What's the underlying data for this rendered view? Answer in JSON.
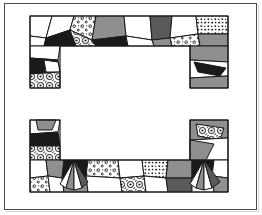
{
  "figure": {
    "background_color": "#ffffff",
    "frame_color": "#4a4a4a",
    "ink_color": "#1a1a1a",
    "canvas": {
      "width": 262,
      "height": 215
    }
  },
  "palette": {
    "white": "#ffffff",
    "light_gray": "#d9d9d9",
    "mid_gray": "#8f8f8f",
    "dark_gray": "#5a5a5a",
    "black": "#1a1a1a",
    "stipple_ink": "#1a1a1a",
    "stipple_ground": "#ffffff"
  },
  "frame": {
    "outer": {
      "x": 4,
      "y": 3,
      "width": 253,
      "height": 207,
      "stroke": 1
    }
  },
  "chart_data": {
    "type": "diagram",
    "xlabel": "",
    "ylabel": "",
    "shapes": [
      {
        "name": "upper-bracket",
        "orientation": "inverted-u",
        "bounds": {
          "x": 28,
          "y": 14,
          "width": 202,
          "height": 75
        },
        "bar": {
          "x": 28,
          "y": 14,
          "width": 202,
          "height": 32
        },
        "left_leg": {
          "x": 28,
          "y": 46,
          "width": 32,
          "height": 43
        },
        "right_leg": {
          "x": 190,
          "y": 46,
          "width": 40,
          "height": 43
        }
      },
      {
        "name": "lower-bracket",
        "orientation": "u",
        "bounds": {
          "x": 28,
          "y": 118,
          "width": 202,
          "height": 76
        },
        "bar": {
          "x": 28,
          "y": 160,
          "width": 202,
          "height": 34
        },
        "left_leg": {
          "x": 28,
          "y": 118,
          "width": 33,
          "height": 42
        },
        "right_leg": {
          "x": 190,
          "y": 118,
          "width": 40,
          "height": 42
        }
      }
    ],
    "fill_kinds": [
      "white",
      "light_gray",
      "mid_gray",
      "dark_gray",
      "black",
      "stipple-rings",
      "stipple-dots",
      "stipple-specks"
    ],
    "patch_count": 58
  },
  "patches": {
    "upper": [
      {
        "id": "u01",
        "fill": "white",
        "pts": "30,16 52,16 46,38 30,36"
      },
      {
        "id": "u02",
        "fill": "white",
        "pts": "52,16 74,16 70,30 46,38"
      },
      {
        "id": "u03",
        "fill": "stipple-dots",
        "pts": "74,16 96,16 92,40 70,30"
      },
      {
        "id": "u04",
        "fill": "mid_gray",
        "pts": "96,16 124,16 126,36 92,40"
      },
      {
        "id": "u05",
        "fill": "white",
        "pts": "124,16 150,16 152,40 126,36"
      },
      {
        "id": "u06",
        "fill": "dark_gray",
        "pts": "150,16 172,16 170,38 152,40"
      },
      {
        "id": "u07",
        "fill": "white",
        "pts": "172,16 196,16 198,34 170,38"
      },
      {
        "id": "u08",
        "fill": "stipple-specks",
        "pts": "196,16 228,16 228,34 198,34"
      },
      {
        "id": "u09",
        "fill": "white",
        "pts": "30,36 46,38 44,44 30,44"
      },
      {
        "id": "u10",
        "fill": "black",
        "pts": "46,38 70,30 74,44 44,44"
      },
      {
        "id": "u11",
        "fill": "stipple-rings",
        "pts": "70,30 92,40 96,44 74,44"
      },
      {
        "id": "u12",
        "fill": "black",
        "pts": "92,40 126,36 128,44 96,44"
      },
      {
        "id": "u13",
        "fill": "white",
        "pts": "126,36 152,40 154,44 128,44"
      },
      {
        "id": "u14",
        "fill": "mid_gray",
        "pts": "152,40 170,38 172,44 154,44"
      },
      {
        "id": "u15",
        "fill": "stipple-dots",
        "pts": "170,38 198,34 200,44 172,44"
      },
      {
        "id": "u16",
        "fill": "mid_gray",
        "pts": "198,34 228,34 228,44 200,44"
      },
      {
        "id": "u17",
        "fill": "white",
        "pts": "30,44 60,44 58,60 30,58"
      },
      {
        "id": "u18",
        "fill": "black",
        "pts": "30,58 58,60 60,72 30,74"
      },
      {
        "id": "u19",
        "fill": "stipple-rings",
        "pts": "30,74 60,72 60,88 30,88"
      },
      {
        "id": "u20",
        "fill": "mid_gray",
        "pts": "190,44 228,44 228,62 190,60"
      },
      {
        "id": "u21",
        "fill": "white",
        "pts": "190,60 228,62 228,74 190,76"
      },
      {
        "id": "u22",
        "fill": "black",
        "pts": "196,62 226,66 222,74 198,72"
      },
      {
        "id": "u23",
        "fill": "mid_gray",
        "pts": "190,76 228,74 228,88 190,88"
      }
    ],
    "lower": [
      {
        "id": "l01",
        "fill": "white",
        "pts": "30,120 60,120 58,132 30,134"
      },
      {
        "id": "l02",
        "fill": "black",
        "pts": "30,134 58,132 60,146 30,146"
      },
      {
        "id": "l03",
        "fill": "stipple-rings",
        "pts": "30,146 60,146 60,160 30,160"
      },
      {
        "id": "l04",
        "fill": "mid_gray",
        "pts": "190,120 228,120 228,138 190,140"
      },
      {
        "id": "l05",
        "fill": "stipple-rings",
        "pts": "190,140 228,138 228,158 190,160"
      },
      {
        "id": "l06",
        "fill": "white",
        "pts": "30,160 46,160 48,176 30,178"
      },
      {
        "id": "l07",
        "fill": "mid_gray",
        "pts": "46,160 64,160 62,178 48,176"
      },
      {
        "id": "l08",
        "fill": "black",
        "pts": "64,160 88,160 86,176 62,178"
      },
      {
        "id": "l09",
        "fill": "stipple-dots",
        "pts": "88,160 118,160 120,178 86,176"
      },
      {
        "id": "l10",
        "fill": "white",
        "pts": "118,160 142,160 144,176 120,178"
      },
      {
        "id": "l11",
        "fill": "stipple-specks",
        "pts": "142,160 168,160 166,178 144,176"
      },
      {
        "id": "l12",
        "fill": "mid_gray",
        "pts": "168,160 192,160 192,178 166,178"
      },
      {
        "id": "l13",
        "fill": "black",
        "pts": "192,160 214,160 212,176 192,178"
      },
      {
        "id": "l14",
        "fill": "white",
        "pts": "214,160 228,160 228,178 212,176"
      },
      {
        "id": "l15",
        "fill": "stipple-dots",
        "pts": "30,178 48,176 50,192 30,192"
      },
      {
        "id": "l16",
        "fill": "white",
        "pts": "48,176 62,178 64,192 50,192"
      },
      {
        "id": "l17",
        "fill": "mid_gray",
        "pts": "62,178 86,176 88,192 64,192"
      },
      {
        "id": "l18",
        "fill": "white",
        "pts": "86,176 120,178 122,192 88,192"
      },
      {
        "id": "l19",
        "fill": "stipple-rings",
        "pts": "120,178 144,176 146,192 122,192"
      },
      {
        "id": "l20",
        "fill": "white",
        "pts": "144,176 166,178 168,192 146,192"
      },
      {
        "id": "l21",
        "fill": "dark_gray",
        "pts": "166,178 192,178 192,192 168,192"
      },
      {
        "id": "l22",
        "fill": "white",
        "pts": "192,178 212,176 214,192 192,192"
      },
      {
        "id": "l23",
        "fill": "mid_gray",
        "pts": "212,176 228,178 228,192 214,192"
      }
    ]
  }
}
